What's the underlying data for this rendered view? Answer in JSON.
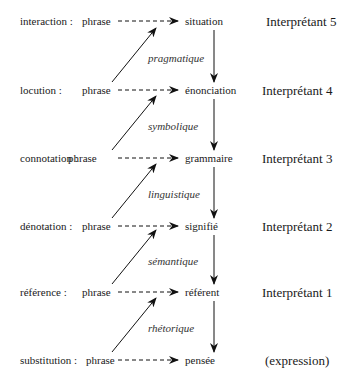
{
  "diagram": {
    "levels": [
      {
        "label": "interaction :",
        "source": "phrase",
        "target": "situation",
        "interpretant": "Interprétant 5"
      },
      {
        "label": "locution :",
        "source": "phrase",
        "target": "énonciation",
        "interpretant": "Interprétant 4"
      },
      {
        "label": "connotation :",
        "source": "phrase",
        "target": "grammaire",
        "interpretant": "Interprétant 3"
      },
      {
        "label": "dénotation :",
        "source": "phrase",
        "target": "signifié",
        "interpretant": "Interprétant 2"
      },
      {
        "label": "référence :",
        "source": "phrase",
        "target": "référent",
        "interpretant": "Interprétant 1"
      },
      {
        "label": "substitution :",
        "source": "phrase",
        "target": "pensée",
        "interpretant": "(expression)"
      }
    ],
    "transitions": [
      "pragmatique",
      "symbolique",
      "linguistique",
      "sémantique",
      "rhétorique"
    ]
  }
}
